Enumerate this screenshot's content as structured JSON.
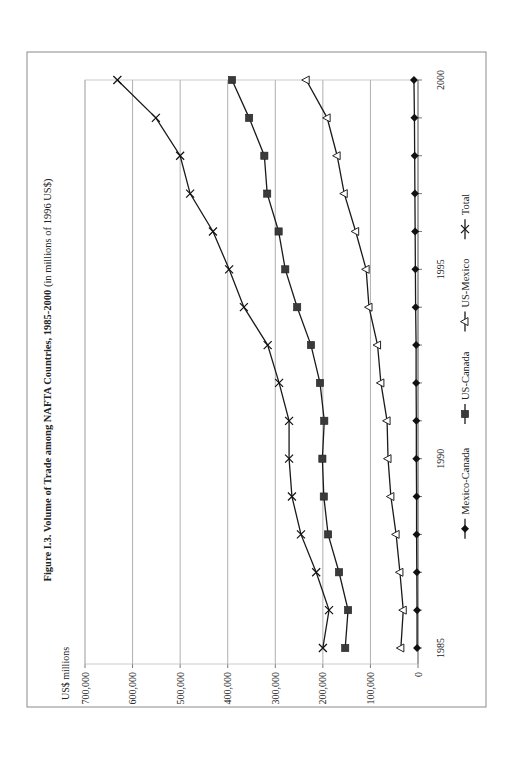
{
  "chart_data": {
    "type": "line",
    "orientation": "rotated 90 degrees counter-clockwise on page",
    "title": "Figure I.3. Volume of Trade among NAFTA Countries, 1985-2000",
    "subtitle": "(in millions of 1996 US$)",
    "xlabel": "",
    "ylabel": "US$ millions",
    "x": [
      1985,
      1986,
      1987,
      1988,
      1989,
      1990,
      1991,
      1992,
      1993,
      1994,
      1995,
      1996,
      1997,
      1998,
      1999,
      2000
    ],
    "x_tick_labels": [
      "1985",
      "1990",
      "1995",
      "2000"
    ],
    "y_tick_labels": [
      "0",
      "100,000",
      "200,000",
      "300,000",
      "400,000",
      "500,000",
      "600,000",
      "700,000"
    ],
    "ylim": [
      0,
      700000
    ],
    "grid": "horizontal major gridlines",
    "legend_position": "bottom",
    "series": [
      {
        "name": "Mexico-Canada",
        "marker": "diamond",
        "values": [
          2000,
          2000,
          2500,
          3000,
          3000,
          3500,
          3500,
          4000,
          4000,
          5000,
          5500,
          6000,
          6500,
          7000,
          7500,
          8500
        ]
      },
      {
        "name": "US-Canada",
        "marker": "square",
        "values": [
          153000,
          147000,
          166000,
          189000,
          198000,
          201000,
          197000,
          206000,
          225000,
          254000,
          279000,
          293000,
          317000,
          323000,
          355000,
          391000
        ]
      },
      {
        "name": "US-Mexico",
        "marker": "triangle",
        "values": [
          36000,
          31000,
          38000,
          46000,
          57000,
          63000,
          65000,
          78000,
          85000,
          103000,
          109000,
          131000,
          155000,
          170000,
          191000,
          235000
        ]
      },
      {
        "name": "Total",
        "marker": "x",
        "values": [
          200000,
          187000,
          214000,
          246000,
          265000,
          271000,
          271000,
          292000,
          316000,
          366000,
          397000,
          431000,
          479000,
          500000,
          551000,
          632000
        ]
      }
    ]
  },
  "figure": {
    "title_bold": "Figure I.3. Volume of Trade among NAFTA Countries, 1985-2000",
    "title_normal": " (in millions of 1996 US$)",
    "y_axis_unit": "US$ millions"
  },
  "legend": {
    "items": [
      {
        "label": "Mexico-Canada",
        "marker": "diamond"
      },
      {
        "label": "US-Canada",
        "marker": "square"
      },
      {
        "label": "US-Mexico",
        "marker": "triangle"
      },
      {
        "label": "Total",
        "marker": "x"
      }
    ]
  },
  "colors": {
    "line": "#1a1a1a",
    "square_fill": "#3a3a3a",
    "triangle_fill": "#ffffff",
    "grid": "#9a9a9a",
    "frame": "#8a8a8a"
  }
}
